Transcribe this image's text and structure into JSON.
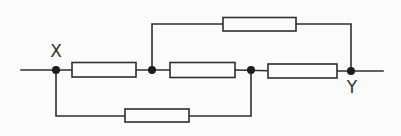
{
  "diagram": {
    "type": "circuit",
    "canvas": {
      "width": 401,
      "height": 136
    },
    "style": {
      "background": "#fbfbfb",
      "line_color": "#2e2e2e",
      "line_width": 1.6,
      "node_fill": "#1c1c1c",
      "node_radius": 4,
      "label_color": "#333333",
      "label_font_size": 17
    },
    "terminals": [
      {
        "id": "X",
        "label": "X",
        "x": 56,
        "y": 70,
        "label_x": 56,
        "label_y": 57
      },
      {
        "id": "Y",
        "label": "Y",
        "x": 351,
        "y": 71,
        "label_x": 352,
        "label_y": 93
      }
    ],
    "junctions": [
      {
        "id": "node-X",
        "x": 56,
        "y": 70
      },
      {
        "id": "node-A",
        "x": 152,
        "y": 70
      },
      {
        "id": "node-B",
        "x": 251,
        "y": 70
      },
      {
        "id": "node-Y",
        "x": 351,
        "y": 71
      }
    ],
    "resistors": [
      {
        "id": "resistor-top-branch",
        "x": 223,
        "y": 17.5,
        "w": 73,
        "h": 13.5,
        "between": [
          "node-A",
          "node-Y"
        ]
      },
      {
        "id": "resistor-main-1",
        "x": 72,
        "y": 62.5,
        "w": 64,
        "h": 14.5,
        "between": [
          "node-X",
          "node-A"
        ]
      },
      {
        "id": "resistor-main-2",
        "x": 170,
        "y": 62.5,
        "w": 65,
        "h": 15,
        "between": [
          "node-A",
          "node-B"
        ]
      },
      {
        "id": "resistor-main-3",
        "x": 268,
        "y": 64,
        "w": 69,
        "h": 14,
        "between": [
          "node-B",
          "node-Y"
        ]
      },
      {
        "id": "resistor-bottom-branch",
        "x": 125,
        "y": 109,
        "w": 64,
        "h": 13,
        "between": [
          "node-X",
          "node-B"
        ]
      }
    ],
    "wires": [
      {
        "id": "lead-left",
        "points": [
          [
            21,
            70
          ],
          [
            72,
            70
          ]
        ]
      },
      {
        "id": "main-wire-A-to-R2",
        "points": [
          [
            136,
            70
          ],
          [
            170,
            70
          ]
        ]
      },
      {
        "id": "main-wire-B-to-R3",
        "points": [
          [
            235,
            70
          ],
          [
            268,
            70.8
          ]
        ]
      },
      {
        "id": "lead-right",
        "points": [
          [
            337,
            71
          ],
          [
            383,
            71
          ]
        ]
      },
      {
        "id": "top-branch-left",
        "points": [
          [
            152,
            70
          ],
          [
            152,
            24
          ],
          [
            223,
            24
          ]
        ]
      },
      {
        "id": "top-branch-right",
        "points": [
          [
            296,
            24
          ],
          [
            351,
            24
          ],
          [
            351,
            71
          ]
        ]
      },
      {
        "id": "bottom-branch-left",
        "points": [
          [
            56,
            70
          ],
          [
            56,
            116
          ],
          [
            125,
            116
          ]
        ]
      },
      {
        "id": "bottom-branch-right",
        "points": [
          [
            189,
            116
          ],
          [
            251,
            116
          ],
          [
            251,
            70
          ]
        ]
      }
    ]
  }
}
